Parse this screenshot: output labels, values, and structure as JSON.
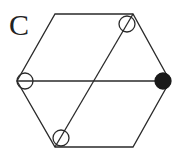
{
  "panel_label": "C",
  "colors": {
    "stroke": "#2a2a2a",
    "filled": "#1a1a1a",
    "background": "#ffffff"
  },
  "hexagon": {
    "vertices": [
      [
        55,
        14
      ],
      [
        133,
        14
      ],
      [
        170,
        81
      ],
      [
        133,
        147
      ],
      [
        55,
        147
      ],
      [
        17,
        81
      ]
    ]
  },
  "lines": [
    {
      "name": "horizontal-diagonal",
      "from": [
        17,
        81
      ],
      "to": [
        170,
        81
      ]
    },
    {
      "name": "slanted-diagonal",
      "from": [
        55,
        147
      ],
      "to": [
        133,
        14
      ]
    }
  ],
  "nodes": [
    {
      "name": "node-top-right",
      "cx": 127,
      "cy": 24,
      "r": 8,
      "filled": false,
      "slash": true
    },
    {
      "name": "node-left",
      "cx": 25,
      "cy": 81,
      "r": 8,
      "filled": false,
      "slash": false
    },
    {
      "name": "node-right",
      "cx": 163,
      "cy": 81,
      "r": 8,
      "filled": true,
      "slash": false
    },
    {
      "name": "node-bottom-left",
      "cx": 61,
      "cy": 138,
      "r": 8,
      "filled": false,
      "slash": true
    }
  ]
}
